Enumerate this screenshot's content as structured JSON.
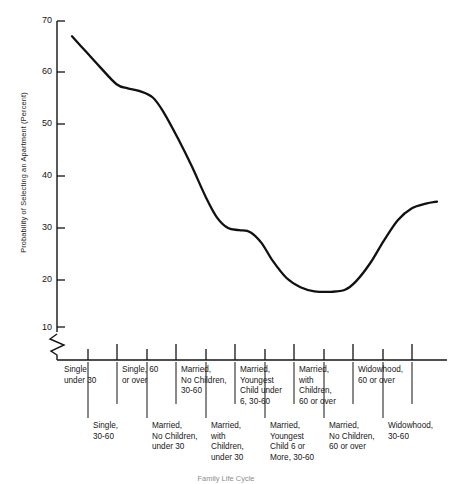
{
  "chart_data": {
    "type": "line",
    "title": "",
    "xlabel": "",
    "ylabel": "Probability of Selecting an Apartment (Percent)",
    "ylim": [
      5,
      72
    ],
    "yticks": [
      10,
      20,
      30,
      40,
      50,
      60,
      70
    ],
    "ytick_labels": [
      "10",
      "20",
      "30",
      "40",
      "50",
      "60",
      "70"
    ],
    "y_axis_break": true,
    "grid": false,
    "legend": "none",
    "categories": [
      "Single under 30",
      "Single, 30-60",
      "Single, 60 or over",
      "Married, No Children, under 30",
      "Married, No Children, 30-60",
      "Married, with Children, under 30",
      "Married, Youngest Child under 6, 30-60",
      "Married, Youngest Child 6 or More, 30-60",
      "Married, with Children, 60 or over",
      "Married, No Children, 60 or over",
      "Widowhood, 30-60",
      "Widowhood, 60 or over"
    ],
    "values": [
      67,
      61,
      57,
      56,
      50,
      38,
      29,
      28,
      19,
      17,
      20,
      31
    ],
    "series": [
      {
        "name": "Probability of Selecting an Apartment",
        "values": [
          67,
          61,
          57,
          56,
          50,
          38,
          29,
          28,
          19,
          17,
          20,
          31
        ]
      }
    ],
    "curve_points": [
      {
        "x": 0.0,
        "y": 67.0
      },
      {
        "x": 0.5,
        "y": 64.0
      },
      {
        "x": 1.0,
        "y": 61.0
      },
      {
        "x": 1.6,
        "y": 57.6
      },
      {
        "x": 2.0,
        "y": 56.8
      },
      {
        "x": 2.4,
        "y": 56.3
      },
      {
        "x": 2.9,
        "y": 55.0
      },
      {
        "x": 3.3,
        "y": 52.0
      },
      {
        "x": 3.8,
        "y": 47.0
      },
      {
        "x": 4.3,
        "y": 41.5
      },
      {
        "x": 4.8,
        "y": 35.5
      },
      {
        "x": 5.2,
        "y": 31.5
      },
      {
        "x": 5.6,
        "y": 29.4
      },
      {
        "x": 6.0,
        "y": 29.0
      },
      {
        "x": 6.4,
        "y": 28.6
      },
      {
        "x": 6.8,
        "y": 26.5
      },
      {
        "x": 7.2,
        "y": 23.0
      },
      {
        "x": 7.7,
        "y": 19.6
      },
      {
        "x": 8.2,
        "y": 17.8
      },
      {
        "x": 8.7,
        "y": 17.0
      },
      {
        "x": 9.3,
        "y": 16.9
      },
      {
        "x": 9.8,
        "y": 17.3
      },
      {
        "x": 10.2,
        "y": 19.0
      },
      {
        "x": 10.7,
        "y": 22.5
      },
      {
        "x": 11.2,
        "y": 27.0
      },
      {
        "x": 11.7,
        "y": 31.0
      },
      {
        "x": 12.2,
        "y": 33.3
      },
      {
        "x": 12.7,
        "y": 34.2
      },
      {
        "x": 13.1,
        "y": 34.6
      }
    ],
    "axis": {
      "line_color": "#141414",
      "curve_color": "#111111",
      "curve_width": 2.3
    }
  },
  "axis_labels": {
    "y_title": "Probability of Selecting an Apartment (Percent)",
    "ticks": [
      "70",
      "60",
      "50",
      "40",
      "30",
      "20",
      "10"
    ]
  },
  "category_rows": {
    "upper": [
      "Single\nunder 30",
      "Single, 60\nor over",
      "Married,\nNo Children,\n30-60",
      "Married,\nYoungest\nChild under\n6, 30-60",
      "Married,\nwith\nChildren,\n60 or over",
      "Widowhood,\n60 or over"
    ],
    "lower": [
      "Single,\n30-60",
      "Married,\nNo Children,\nunder 30",
      "Married,\nwith\nChildren,\nunder 30",
      "Married,\nYoungest\nChild 6 or\nMore, 30-60",
      "Married,\nNo Children,\n60 or over",
      "Widowhood,\n30-60"
    ]
  },
  "caption": {
    "text": "Family Life Cycle"
  }
}
